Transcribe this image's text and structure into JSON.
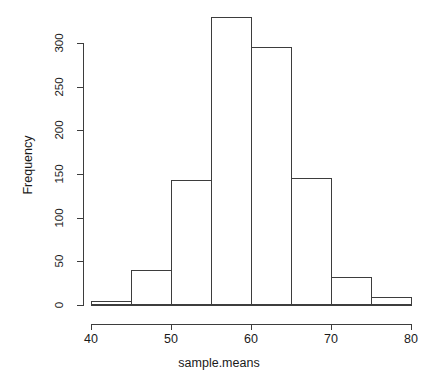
{
  "chart_data": {
    "type": "bar",
    "subtype": "histogram",
    "title": "",
    "xlabel": "sample.means",
    "ylabel": "Frequency",
    "categories": [
      "40-45",
      "45-50",
      "50-55",
      "55-60",
      "60-65",
      "65-70",
      "70-75",
      "75-80"
    ],
    "bin_edges": [
      40,
      45,
      50,
      55,
      60,
      65,
      70,
      75,
      80
    ],
    "values": [
      5,
      40,
      143,
      330,
      296,
      146,
      32,
      9
    ],
    "bins": [
      {
        "left": 40,
        "right": 45,
        "count": 5
      },
      {
        "left": 45,
        "right": 50,
        "count": 40
      },
      {
        "left": 50,
        "right": 55,
        "count": 143
      },
      {
        "left": 55,
        "right": 60,
        "count": 330
      },
      {
        "left": 60,
        "right": 65,
        "count": 296
      },
      {
        "left": 65,
        "right": 70,
        "count": 146
      },
      {
        "left": 70,
        "right": 75,
        "count": 32
      },
      {
        "left": 75,
        "right": 80,
        "count": 9
      }
    ],
    "xlim": [
      40,
      80
    ],
    "ylim": [
      0,
      333
    ],
    "xticks": [
      40,
      50,
      60,
      70,
      80
    ],
    "yticks": [
      0,
      50,
      100,
      150,
      200,
      250,
      300
    ],
    "xtick_labels": [
      "40",
      "50",
      "60",
      "70",
      "80"
    ],
    "ytick_labels": [
      "0",
      "50",
      "100",
      "150",
      "200",
      "250",
      "300"
    ],
    "grid": false,
    "legend": null,
    "bar_fill": "#ffffff",
    "bar_border": "#3d3d3d",
    "axis_color": "#3d3d3d",
    "background": "#ffffff"
  }
}
